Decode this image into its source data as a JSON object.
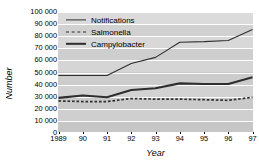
{
  "chart_data": {
    "type": "line",
    "title": "",
    "xlabel": "Year",
    "ylabel": "Number",
    "x": [
      1989,
      1990,
      1991,
      1992,
      1993,
      1994,
      1995,
      1996,
      1997
    ],
    "xtick_labels": [
      "1989",
      "90",
      "91",
      "92",
      "93",
      "94",
      "95",
      "96",
      "97"
    ],
    "ytick_labels": [
      "0",
      "10 000",
      "20 000",
      "30 000",
      "40 000",
      "50 000",
      "60 000",
      "70 000",
      "80 000",
      "90 000",
      "100 000"
    ],
    "ytick_values": [
      0,
      10000,
      20000,
      30000,
      40000,
      50000,
      60000,
      70000,
      80000,
      90000,
      100000
    ],
    "ylim": [
      0,
      100000
    ],
    "xlim": [
      1989,
      1997
    ],
    "grid": true,
    "grid_orientation": "horizontal",
    "grid_color": "#ffffff",
    "plot_background": "#c9c9c9",
    "legend_position": "upper-left-inside",
    "series": [
      {
        "name": "Notifications",
        "style": "solid-thin",
        "color": "#2e2e2e",
        "values": [
          47500,
          47500,
          47500,
          57500,
          62500,
          75000,
          75500,
          76500,
          85500
        ]
      },
      {
        "name": "Salmonella",
        "style": "dashed",
        "color": "#2e2e2e",
        "values": [
          26500,
          26000,
          26000,
          28500,
          28000,
          28000,
          27500,
          27000,
          29500
        ]
      },
      {
        "name": "Campylobacter",
        "style": "solid-thick",
        "color": "#2e2e2e",
        "values": [
          29000,
          31000,
          29500,
          35500,
          37000,
          41000,
          40500,
          40500,
          46000
        ]
      }
    ]
  }
}
